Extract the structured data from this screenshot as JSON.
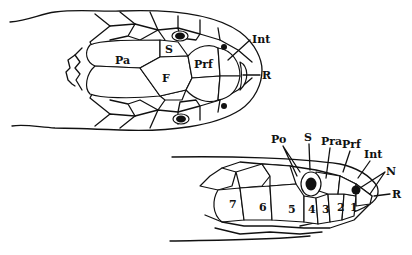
{
  "diagram": {
    "dorsal_view": {
      "labels": {
        "parietal": "Pa",
        "supraocular": "S",
        "frontal": "F",
        "prefrontal": "Prf",
        "internasal": "Int",
        "rostral": "R"
      }
    },
    "lateral_view": {
      "labels": {
        "postocular": "Po",
        "supraocular": "S",
        "preocular": "Pra",
        "prefrontal": "Prf",
        "internasal": "Int",
        "nasal": "N",
        "rostral": "R"
      },
      "supralabials": [
        "7",
        "6",
        "5",
        "4",
        "3",
        "2",
        "1"
      ]
    }
  }
}
